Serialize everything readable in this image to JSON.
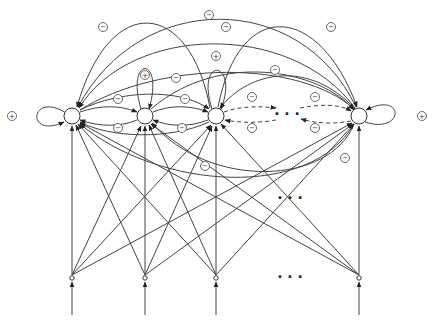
{
  "diagram": {
    "type": "recurrent neural network graph",
    "colors": {
      "stroke": "#333333",
      "background": "#ffffff"
    },
    "neurons": [
      {
        "id": "n1",
        "x": 72,
        "y": 116,
        "self_loop_sign": "+",
        "self_loop_side": "left"
      },
      {
        "id": "n2",
        "x": 145,
        "y": 116,
        "self_loop_sign": "+",
        "self_loop_side": "top"
      },
      {
        "id": "n3",
        "x": 216,
        "y": 116,
        "self_loop_sign": "+",
        "self_loop_side": "top"
      },
      {
        "id": "n4",
        "x": 359,
        "y": 116,
        "self_loop_sign": "+",
        "self_loop_side": "right"
      }
    ],
    "inputs": [
      {
        "id": "i1",
        "x": 72,
        "y": 278
      },
      {
        "id": "i2",
        "x": 145,
        "y": 278
      },
      {
        "id": "i3",
        "x": 216,
        "y": 278
      },
      {
        "id": "i4",
        "x": 359,
        "y": 278
      }
    ],
    "signs": {
      "plus": "+",
      "minus": "−"
    },
    "ellipsis_labels": {
      "between_neurons": "· · ·",
      "middle_connections": "· · ·",
      "between_inputs": "· · ·"
    }
  }
}
